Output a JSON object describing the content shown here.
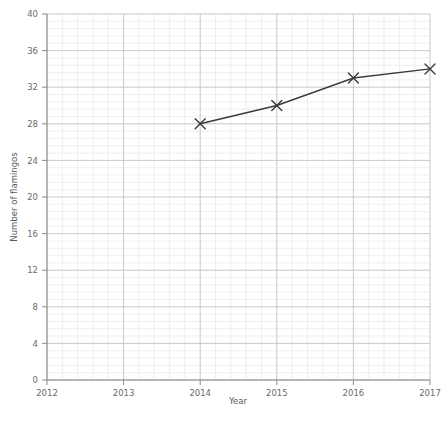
{
  "chart_data": {
    "type": "line",
    "title": "",
    "subtitle": "",
    "xlabel": "Year",
    "ylabel": "Number of flamingos",
    "x": [
      2014,
      2015,
      2016,
      2017
    ],
    "values": [
      28,
      30,
      33,
      34
    ],
    "series": [
      {
        "name": "Number of flamingos",
        "x": [
          2014,
          2015,
          2016,
          2017
        ],
        "values": [
          28,
          30,
          33,
          34
        ],
        "marker": "x-cross",
        "line_color": "#3a3a3a",
        "marker_color": "#3a3a3a"
      }
    ],
    "xlim": [
      2012,
      2017
    ],
    "ylim": [
      0,
      40
    ],
    "xticks": [
      2012,
      2013,
      2014,
      2015,
      2016,
      2017
    ],
    "xtick_labels": [
      "2012",
      "2013",
      "2014",
      "2015",
      "2016",
      "2017"
    ],
    "yticks": [
      0,
      4,
      8,
      12,
      16,
      20,
      24,
      28,
      32,
      36,
      40
    ],
    "ytick_labels": [
      "0",
      "4",
      "8",
      "12",
      "16",
      "20",
      "24",
      "28",
      "32",
      "36",
      "40"
    ],
    "grid": true,
    "grid_style": "graph-paper",
    "minor_grid": true,
    "minor_per_major": 5,
    "legend": false,
    "legend_position": "none",
    "annotations": []
  },
  "colors": {
    "background": "#ffffff",
    "axis": "#8a8a8a",
    "tick_text": "#6b6b6b",
    "axis_title": "#5a5a5a",
    "grid_minor": "#e4e4e4",
    "grid_major": "#bfbfbf",
    "data_line": "#3a3a3a",
    "data_marker": "#3a3a3a"
  },
  "geometry": {
    "plot_left": 47,
    "plot_right": 430,
    "plot_top": 14,
    "plot_bottom": 380
  }
}
